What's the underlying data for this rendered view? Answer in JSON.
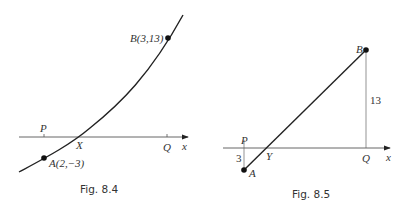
{
  "figures": [
    {
      "id": "fig84",
      "caption": "Fig. 8.4",
      "axis_label": "x",
      "point_labels": {
        "P": "P",
        "X": "X",
        "Q": "Q",
        "A": "A(2,−3)",
        "B": "B(3,13)"
      },
      "description": "Curve through A(2,-3) and B(3,13) crossing the x-axis at X"
    },
    {
      "id": "fig85",
      "caption": "Fig. 8.5",
      "axis_label": "x",
      "point_labels": {
        "P": "P",
        "Y": "Y",
        "Q": "Q",
        "A": "A",
        "B": "B"
      },
      "lengths": {
        "PA": "3",
        "QB": "13"
      },
      "description": "Straight chord from A to B crossing the x-axis at Y, with perpendiculars of length 3 and 13"
    }
  ],
  "colors": {
    "line": "#222222",
    "thin_line": "#555555",
    "text": "#333333",
    "background": "#ffffff"
  }
}
